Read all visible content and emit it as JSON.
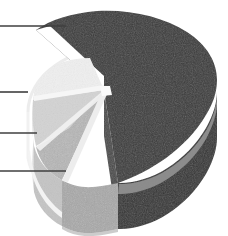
{
  "figure": {
    "width": 228,
    "height": 236,
    "background_color": "#ffffff"
  },
  "chart_data": {
    "type": "pie",
    "title": "",
    "subtitle": "",
    "xlabel": "",
    "ylabel": "",
    "legend": "none",
    "grid": false,
    "three_d": true,
    "exploded": false,
    "ghost_outline": true,
    "start_angle_deg": 140,
    "direction": "clockwise",
    "categories": [
      "Segment 1",
      "Segment 2",
      "Segment 3",
      "Segment 4"
    ],
    "values": [
      72,
      9,
      8,
      11
    ],
    "units": "percent",
    "series": [
      {
        "name": "Segment shares",
        "values": [
          72,
          9,
          8,
          11
        ]
      }
    ],
    "slices": [
      {
        "index": 0,
        "label": "Segment 1",
        "value": 72,
        "color": "#3a3a3a",
        "side_color": "#333333",
        "rim_band_color": "#8f8f8f",
        "callout": 1
      },
      {
        "index": 1,
        "label": "Segment 2",
        "value": 9,
        "color": "#efefef",
        "side_color": "#dcdcdc",
        "rim_band_color": "#f6f6f6",
        "callout": 2
      },
      {
        "index": 2,
        "label": "Segment 3",
        "value": 8,
        "color": "#d3d3d3",
        "side_color": "#c4c4c4",
        "rim_band_color": "#e4e4e4",
        "callout": 3
      },
      {
        "index": 3,
        "label": "Segment 4",
        "value": 11,
        "color": "#b6b6b6",
        "side_color": "#a8a8a8",
        "rim_band_color": "#cfcfcf",
        "callout": 4
      }
    ]
  },
  "callouts": [
    {
      "id": "callout-1",
      "target_slice": "Segment 1",
      "label": "",
      "line_y": 26,
      "line_x1": 0,
      "line_x2": 66
    },
    {
      "id": "callout-2",
      "target_slice": "Segment 2",
      "label": "",
      "line_y": 92,
      "line_x1": 0,
      "line_x2": 28
    },
    {
      "id": "callout-3",
      "target_slice": "Segment 3",
      "label": "",
      "line_y": 133,
      "line_x1": 0,
      "line_x2": 37
    },
    {
      "id": "callout-4",
      "target_slice": "Segment 4",
      "label": "",
      "line_y": 171,
      "line_x1": 0,
      "line_x2": 66
    }
  ],
  "colors": {
    "dark_slice": "#3a3a3a",
    "dark_slice_side": "#333333",
    "rim_highlight": "#8f8f8f",
    "white_slice": "#efefef",
    "light_slice": "#d3d3d3",
    "mid_slice": "#b6b6b6",
    "ghost_outline": "#e9e9e9",
    "callout_line": "#3f3f3f",
    "background": "#ffffff"
  }
}
